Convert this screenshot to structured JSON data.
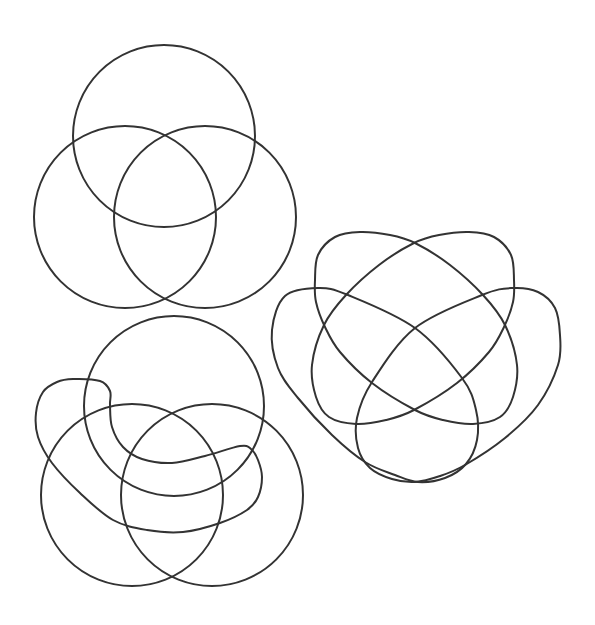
{
  "page": {
    "width": 595,
    "height": 625,
    "background": "#ffffff",
    "stroke_color": "#333333",
    "stroke_width": 2
  },
  "diagrams": [
    {
      "id": "three-circle-venn",
      "label": "Three-set Venn diagram (circles)",
      "shapes": [
        {
          "name": "set-top-circle",
          "type": "circle",
          "cx": 164,
          "cy": 136,
          "r": 91
        },
        {
          "name": "set-left-circle",
          "type": "circle",
          "cx": 125,
          "cy": 217,
          "r": 91
        },
        {
          "name": "set-right-circle",
          "type": "circle",
          "cx": 205,
          "cy": 217,
          "r": 91
        }
      ]
    },
    {
      "id": "four-ellipse-venn",
      "label": "Four-set Venn diagram (ellipses)",
      "shapes": [
        {
          "name": "set-upper-left-ellipse",
          "type": "closed-curve",
          "points": [
            [
              315,
              280
            ],
            [
              318,
              255
            ],
            [
              335,
              237
            ],
            [
              360,
              232
            ],
            [
              390,
              235
            ],
            [
              415,
              243
            ],
            [
              450,
              265
            ],
            [
              483,
              295
            ],
            [
              505,
              325
            ],
            [
              517,
              365
            ],
            [
              513,
              397
            ],
            [
              500,
              417
            ],
            [
              473,
              424
            ],
            [
              443,
              420
            ],
            [
              415,
              410
            ],
            [
              372,
              383
            ],
            [
              340,
              352
            ],
            [
              325,
              327
            ],
            [
              316,
              302
            ]
          ]
        },
        {
          "name": "set-upper-right-ellipse",
          "type": "closed-curve",
          "points": [
            [
              514,
              280
            ],
            [
              511,
              255
            ],
            [
              494,
              237
            ],
            [
              469,
              232
            ],
            [
              439,
              235
            ],
            [
              414,
              243
            ],
            [
              379,
              265
            ],
            [
              346,
              295
            ],
            [
              324,
              325
            ],
            [
              312,
              365
            ],
            [
              316,
              397
            ],
            [
              329,
              417
            ],
            [
              356,
              424
            ],
            [
              386,
              420
            ],
            [
              414,
              410
            ],
            [
              457,
              383
            ],
            [
              489,
              352
            ],
            [
              504,
              327
            ],
            [
              513,
              302
            ]
          ]
        },
        {
          "name": "set-left-outer-ellipse",
          "type": "closed-curve",
          "points": [
            [
              272,
              330
            ],
            [
              285,
              296
            ],
            [
              318,
              288
            ],
            [
              348,
              295
            ],
            [
              415,
              328
            ],
            [
              462,
              378
            ],
            [
              476,
              410
            ],
            [
              477,
              440
            ],
            [
              466,
              464
            ],
            [
              445,
              478
            ],
            [
              418,
              482
            ],
            [
              395,
              475
            ],
            [
              365,
              462
            ],
            [
              332,
              435
            ],
            [
              298,
              398
            ],
            [
              278,
              368
            ]
          ]
        },
        {
          "name": "set-right-outer-ellipse",
          "type": "closed-curve",
          "points": [
            [
              560,
              335
            ],
            [
              555,
              308
            ],
            [
              538,
              292
            ],
            [
              513,
              288
            ],
            [
              482,
              295
            ],
            [
              415,
              328
            ],
            [
              372,
              382
            ],
            [
              357,
              418
            ],
            [
              358,
              448
            ],
            [
              370,
              468
            ],
            [
              392,
              479
            ],
            [
              415,
              482
            ],
            [
              440,
              476
            ],
            [
              465,
              465
            ],
            [
              505,
              438
            ],
            [
              538,
              405
            ],
            [
              558,
              365
            ]
          ]
        }
      ]
    },
    {
      "id": "circles-and-bean-venn",
      "label": "Four-set Venn diagram (three circles and a bean shape)",
      "shapes": [
        {
          "name": "set-top-circle",
          "type": "circle",
          "cx": 174,
          "cy": 406,
          "r": 90
        },
        {
          "name": "set-left-circle",
          "type": "circle",
          "cx": 132,
          "cy": 495,
          "r": 91
        },
        {
          "name": "set-right-circle",
          "type": "circle",
          "cx": 212,
          "cy": 495,
          "r": 91
        },
        {
          "name": "set-bean-shape",
          "type": "closed-curve",
          "points": [
            [
              73,
              379
            ],
            [
              100,
              381
            ],
            [
              110,
              391
            ],
            [
              110,
              405
            ],
            [
              112,
              427
            ],
            [
              123,
              447
            ],
            [
              142,
              459
            ],
            [
              172,
              463
            ],
            [
              205,
              456
            ],
            [
              240,
              446
            ],
            [
              251,
              449
            ],
            [
              258,
              460
            ],
            [
              262,
              477
            ],
            [
              258,
              497
            ],
            [
              247,
              510
            ],
            [
              220,
              523
            ],
            [
              183,
              532
            ],
            [
              147,
              530
            ],
            [
              113,
              520
            ],
            [
              80,
              493
            ],
            [
              52,
              463
            ],
            [
              38,
              437
            ],
            [
              36,
              413
            ],
            [
              43,
              392
            ],
            [
              57,
              382
            ]
          ]
        }
      ]
    }
  ]
}
